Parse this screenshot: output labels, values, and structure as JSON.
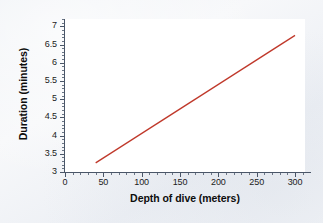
{
  "chart_data": {
    "type": "line",
    "title": "",
    "xlabel": "Depth of dive (meters)",
    "ylabel": "Duration (minutes)",
    "xlim": [
      0,
      313
    ],
    "ylim": [
      3,
      7.2
    ],
    "grid": false,
    "legend": null,
    "line_color": "#c0392b",
    "plot_background": "#ffffff",
    "figure_background": "#f2f4f7",
    "axis_color": "#4a5668",
    "xticks": [
      0,
      50,
      100,
      150,
      200,
      250,
      300
    ],
    "xtick_labels": [
      "0",
      "50",
      "100",
      "150",
      "200",
      "250",
      "300"
    ],
    "xtick_minor_step": 10,
    "yticks": [
      3,
      3.5,
      4,
      4.5,
      5,
      5.5,
      6,
      6.5,
      7
    ],
    "ytick_labels": [
      "3",
      "3.5",
      "4",
      "4.5",
      "5",
      "5.5",
      "6",
      "6.5",
      "7"
    ],
    "ytick_minor_step": 0.1,
    "series": [
      {
        "name": "dive duration",
        "x": [
          40,
          300
        ],
        "y": [
          3.25,
          6.75
        ]
      }
    ]
  }
}
